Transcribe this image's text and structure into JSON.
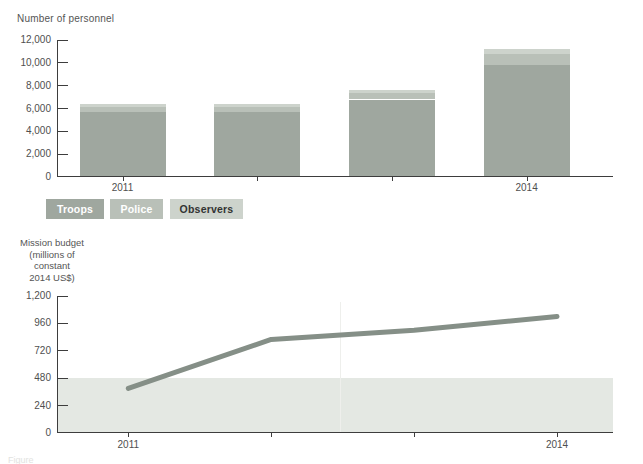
{
  "figure": {
    "caption": "Figure"
  },
  "legend": {
    "items": [
      {
        "label": "Troops",
        "color": "#9fa79f",
        "text_color": "#ffffff"
      },
      {
        "label": "Police",
        "color": "#b9c0b8",
        "text_color": "#ffffff"
      },
      {
        "label": "Observers",
        "color": "#cdd3cc",
        "text_color": "#333333"
      }
    ]
  },
  "chart_data": [
    {
      "type": "bar",
      "stacked": true,
      "title": "Number of personnel",
      "categories": [
        "2011",
        "2012",
        "2013",
        "2014"
      ],
      "visible_category_labels": [
        "2011",
        "2014"
      ],
      "series": [
        {
          "name": "Troops",
          "color": "#9fa79f",
          "values": [
            5600,
            5600,
            6700,
            9750
          ]
        },
        {
          "name": "Police",
          "color": "#b9c0b8",
          "values": [
            450,
            450,
            550,
            950
          ]
        },
        {
          "name": "Observers",
          "color": "#cdd3cc",
          "values": [
            300,
            300,
            300,
            400
          ]
        }
      ],
      "ylim": [
        0,
        12000
      ],
      "yticks": [
        {
          "value": 0,
          "label": "0"
        },
        {
          "value": 2000,
          "label": "2,000"
        },
        {
          "value": 4000,
          "label": "4,000"
        },
        {
          "value": 6000,
          "label": "6,000"
        },
        {
          "value": 8000,
          "label": "8,000"
        },
        {
          "value": 10000,
          "label": "10,000"
        },
        {
          "value": 12000,
          "label": "12,000"
        }
      ],
      "grid": false,
      "legend_position": "below"
    },
    {
      "type": "line",
      "title": "Mission budget (millions of constant 2014 US$)",
      "title_lines": [
        "Mission budget",
        "(millions of",
        "constant",
        "2014 US$)"
      ],
      "x": [
        "2011",
        "2012",
        "2013",
        "2014"
      ],
      "visible_x_labels": [
        "2011",
        "2014"
      ],
      "values": [
        390,
        820,
        900,
        1020
      ],
      "ylim": [
        0,
        1200
      ],
      "yticks": [
        {
          "value": 0,
          "label": "0"
        },
        {
          "value": 240,
          "label": "240"
        },
        {
          "value": 480,
          "label": "480"
        },
        {
          "value": 720,
          "label": "720"
        },
        {
          "value": 960,
          "label": "960"
        },
        {
          "value": 1200,
          "label": "1,200"
        }
      ],
      "shaded_band": {
        "from": 0,
        "to": 480,
        "color": "#e4e8e3"
      },
      "line_color": "#858f87",
      "grid": false
    }
  ]
}
